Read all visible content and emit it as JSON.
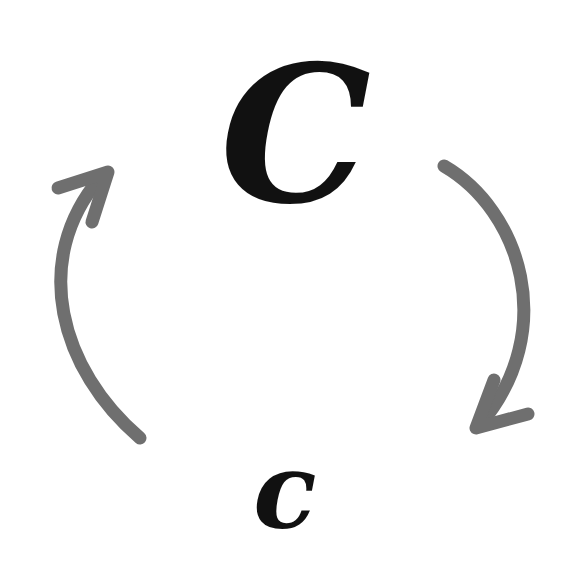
{
  "diagram": {
    "type": "cycle",
    "nodes": [
      {
        "id": "upper",
        "label": "C",
        "position": "top"
      },
      {
        "id": "lower",
        "label": "c",
        "position": "bottom"
      }
    ],
    "edges": [
      {
        "from": "upper",
        "to": "lower",
        "side": "right",
        "direction": "clockwise-down"
      },
      {
        "from": "lower",
        "to": "upper",
        "side": "left",
        "direction": "up"
      }
    ],
    "colors": {
      "arrow": "#6f6f6f",
      "text": "#111111",
      "background": "#ffffff"
    }
  }
}
